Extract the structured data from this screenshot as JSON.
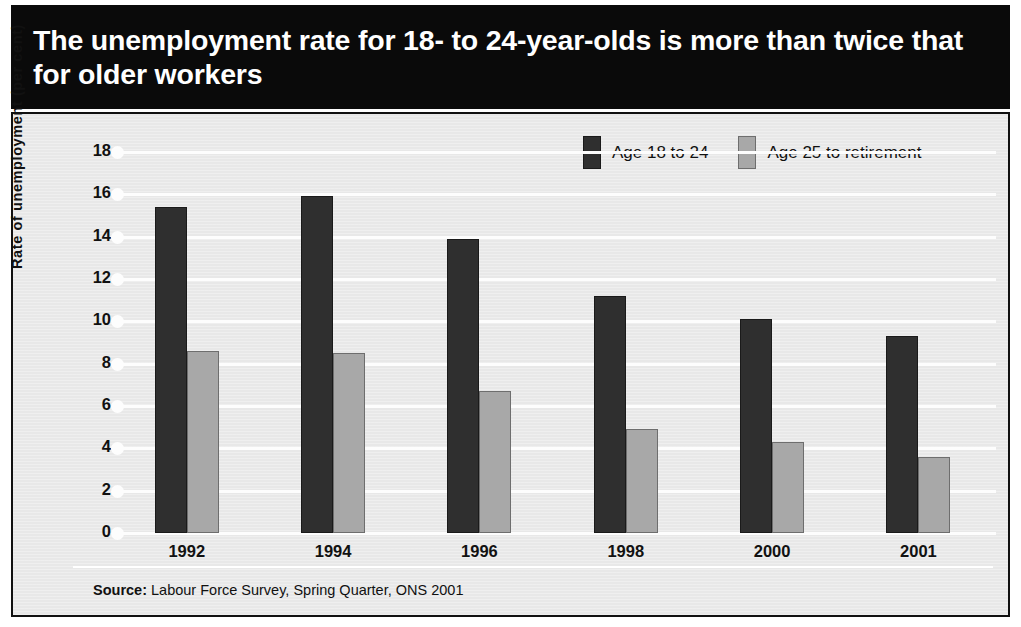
{
  "title": "The unemployment rate for 18- to 24-year-olds is more than twice that for older workers",
  "source_prefix": "Source:",
  "source_text": "Labour Force Survey, Spring Quarter, ONS 2001",
  "colors": {
    "title_band": "#0a0a0a",
    "panel": "#e8e8e8",
    "series_dark": "#2f2f2f",
    "series_light": "#a8a8a8",
    "gridline": "#fdfdfd"
  },
  "chart_data": {
    "type": "bar",
    "title": "The unemployment rate for 18- to 24-year-olds is more than twice that for older workers",
    "xlabel": "",
    "ylabel": "Rate of unemployment (per cent)",
    "categories": [
      "1992",
      "1994",
      "1996",
      "1998",
      "2000",
      "2001"
    ],
    "series": [
      {
        "name": "Age 18 to 24",
        "color": "#2f2f2f",
        "values": [
          15.4,
          15.9,
          13.9,
          11.2,
          10.1,
          9.3
        ]
      },
      {
        "name": "Age 25 to retirement",
        "color": "#a8a8a8",
        "values": [
          8.6,
          8.5,
          6.7,
          4.9,
          4.3,
          3.6
        ]
      }
    ],
    "ylim": [
      0,
      18
    ],
    "yticks": [
      "0",
      "2",
      "4",
      "6",
      "8",
      "10",
      "12",
      "14",
      "16",
      "18"
    ],
    "grid": true,
    "legend_position": "top-right"
  }
}
